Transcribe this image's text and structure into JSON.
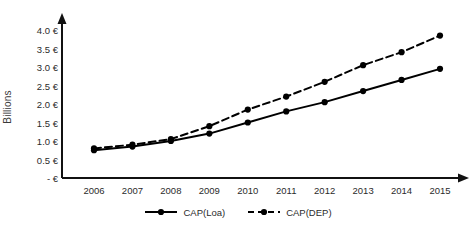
{
  "chart_data": {
    "type": "line",
    "title": "",
    "xlabel": "",
    "ylabel": "Billions",
    "categories": [
      "2006",
      "2007",
      "2008",
      "2009",
      "2010",
      "2011",
      "2012",
      "2013",
      "2014",
      "2015"
    ],
    "x": [
      2006,
      2007,
      2008,
      2009,
      2010,
      2011,
      2012,
      2013,
      2014,
      2015
    ],
    "ylim": [
      0,
      4.25
    ],
    "xlim": [
      2005.6,
      2015.4
    ],
    "grid": false,
    "legend_position": "bottom-center",
    "ytick_labels": [
      "4.0 €",
      "3.5 €",
      "3.0 €",
      "2.5 €",
      "2.0 €",
      "1.5 €",
      "1.0 €",
      "0.5 €",
      "-  €"
    ],
    "ytick_values": [
      4.0,
      3.5,
      3.0,
      2.5,
      2.0,
      1.5,
      1.0,
      0.5,
      0.0
    ],
    "series": [
      {
        "name": "CAP(Loa)",
        "linestyle": "solid",
        "marker": "circle",
        "color": "#000000",
        "values": [
          0.75,
          0.85,
          1.0,
          1.2,
          1.5,
          1.8,
          2.05,
          2.35,
          2.65,
          2.95
        ]
      },
      {
        "name": "CAP(DEP)",
        "linestyle": "dashed",
        "marker": "circle",
        "color": "#000000",
        "values": [
          0.8,
          0.9,
          1.05,
          1.4,
          1.85,
          2.2,
          2.6,
          3.05,
          3.4,
          3.85
        ]
      }
    ]
  },
  "legend": {
    "items": [
      {
        "label": "CAP(Loa)",
        "style": "solid"
      },
      {
        "label": "CAP(DEP)",
        "style": "dashed"
      }
    ]
  },
  "axes": {
    "y_axis_title": "Billions"
  },
  "colors": {
    "series": "#000000",
    "axis": "#111111",
    "background": "#ffffff",
    "tick_text": "#2b2b2b"
  }
}
